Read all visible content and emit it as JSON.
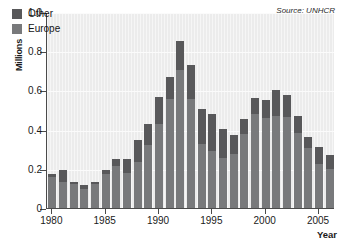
{
  "chart_data": {
    "type": "bar",
    "title": "",
    "subtitle": "",
    "stacked": true,
    "xlabel": "Year",
    "ylabel": "Millions",
    "ylim": [
      0,
      1.0
    ],
    "xlim": [
      1979.5,
      2006.5
    ],
    "yticks": [
      "0",
      "0.2",
      "0.4",
      "0.6",
      "0.8",
      "1.0"
    ],
    "ytick_values": [
      0,
      0.2,
      0.4,
      0.6,
      0.8,
      1.0
    ],
    "xticks": [
      "1980",
      "1985",
      "1990",
      "1995",
      "2000",
      "2005"
    ],
    "xtick_values": [
      1980,
      1985,
      1990,
      1995,
      2000,
      2005
    ],
    "grid": true,
    "legend_position": "top-left",
    "annotation": "Source: UNHCR",
    "categories": [
      1980,
      1981,
      1982,
      1983,
      1984,
      1985,
      1986,
      1987,
      1988,
      1989,
      1990,
      1991,
      1992,
      1993,
      1994,
      1995,
      1996,
      1997,
      1998,
      1999,
      2000,
      2001,
      2002,
      2003,
      2004,
      2005,
      2006
    ],
    "series": [
      {
        "name": "Europe",
        "color": "#78797b",
        "values": [
          0.16,
          0.135,
          0.12,
          0.095,
          0.12,
          0.175,
          0.215,
          0.18,
          0.235,
          0.32,
          0.43,
          0.555,
          0.705,
          0.555,
          0.325,
          0.29,
          0.255,
          0.275,
          0.38,
          0.48,
          0.46,
          0.47,
          0.465,
          0.385,
          0.305,
          0.225,
          0.2
        ]
      },
      {
        "name": "Other",
        "color": "#58585a",
        "values": [
          0.015,
          0.06,
          0.015,
          0.025,
          0.015,
          0.02,
          0.035,
          0.07,
          0.11,
          0.11,
          0.135,
          0.115,
          0.145,
          0.175,
          0.18,
          0.19,
          0.15,
          0.1,
          0.075,
          0.08,
          0.09,
          0.13,
          0.11,
          0.085,
          0.055,
          0.085,
          0.07
        ]
      }
    ],
    "totals": [
      0.175,
      0.195,
      0.135,
      0.12,
      0.135,
      0.195,
      0.25,
      0.25,
      0.345,
      0.43,
      0.565,
      0.67,
      0.85,
      0.73,
      0.505,
      0.48,
      0.405,
      0.375,
      0.455,
      0.56,
      0.55,
      0.6,
      0.575,
      0.47,
      0.36,
      0.31,
      0.27
    ]
  },
  "legend": {
    "items": [
      {
        "label": "Other",
        "color": "#58585a"
      },
      {
        "label": "Europe",
        "color": "#78797b"
      }
    ]
  }
}
